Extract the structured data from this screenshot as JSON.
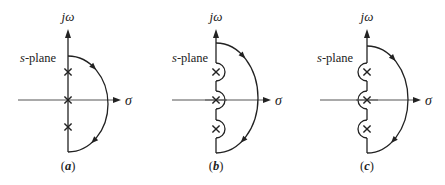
{
  "figure": {
    "panels": [
      {
        "id": "a",
        "caption": "(a)",
        "caption_letter": "a",
        "axis_x": 68,
        "arc_top": 56,
        "arc_bottom": 152,
        "arc_right": 108,
        "h_axis_y": 100,
        "h_axis_start": 18,
        "h_axis_end": 121,
        "poles_y": [
          72,
          100,
          127
        ],
        "indentation": "none",
        "vertical_label": "jω",
        "horizontal_label": "σ",
        "plane_label": "s-plane",
        "plane_label_x": 20
      },
      {
        "id": "b",
        "caption": "(b)",
        "caption_letter": "b",
        "axis_x": 216,
        "arc_top": 43,
        "arc_bottom": 153,
        "arc_right": 258,
        "h_axis_y": 100,
        "h_axis_start": 172,
        "h_axis_end": 271,
        "poles_y": [
          72,
          100,
          129
        ],
        "indentation": "right",
        "vertical_label": "jω",
        "horizontal_label": "σ",
        "plane_label": "s-plane",
        "plane_label_x": 172
      },
      {
        "id": "c",
        "caption": "(c)",
        "caption_letter": "c",
        "axis_x": 367,
        "arc_top": 46,
        "arc_bottom": 153,
        "arc_right": 408,
        "h_axis_y": 100,
        "h_axis_start": 320,
        "h_axis_end": 421,
        "poles_y": [
          72,
          100,
          129
        ],
        "indentation": "left",
        "vertical_label": "jω",
        "horizontal_label": "σ",
        "plane_label": "s-plane",
        "plane_label_x": 317
      }
    ],
    "indent_radius": 9,
    "line_color": "#222222",
    "axis_color": "#555555"
  }
}
